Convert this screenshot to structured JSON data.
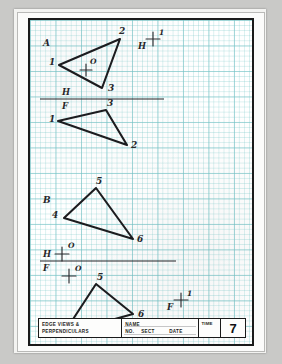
{
  "document": {
    "type": "engineering-graphics-worksheet",
    "sheet_number": "7"
  },
  "title_block": {
    "description_line1": "EDGE VIEWS &",
    "description_line2": "PERPENDICULARS",
    "name_label": "NAME",
    "no_label": "NO.",
    "sect_label": "SECT",
    "date_label": "DATE",
    "time_label": "TIME",
    "page_number": "7"
  },
  "problems": [
    {
      "id": "A",
      "label": "A",
      "views": [
        {
          "view": "horizontal",
          "plane_label": "H",
          "point_label": "O",
          "vertices": [
            {
              "label": "1",
              "x": 29,
              "y": 45
            },
            {
              "label": "2",
              "x": 90,
              "y": 19
            },
            {
              "label": "3",
              "x": 72,
              "y": 68
            }
          ]
        },
        {
          "view": "frontal",
          "plane_label": "F",
          "vertices": [
            {
              "label": "1",
              "x": 28,
              "y": 101
            },
            {
              "label": "3",
              "x": 76,
              "y": 90
            },
            {
              "label": "2",
              "x": 97,
              "y": 125
            }
          ]
        }
      ],
      "fold_line": {
        "label_top": "H",
        "label_bottom": "F",
        "y": 79
      },
      "aux_mark": {
        "plane_label": "H",
        "prime": "1",
        "x": 122,
        "y": 22
      }
    },
    {
      "id": "B",
      "label": "B",
      "views": [
        {
          "view": "horizontal",
          "plane_label": "H",
          "point_label": "O",
          "vertices": [
            {
              "label": "5",
              "x": 66,
              "y": 168
            },
            {
              "label": "4",
              "x": 34,
              "y": 198
            },
            {
              "label": "6",
              "x": 103,
              "y": 219
            }
          ]
        },
        {
          "view": "frontal",
          "plane_label": "F",
          "point_label": "O",
          "vertices": [
            {
              "label": "5",
              "x": 66,
              "y": 264
            },
            {
              "label": "6",
              "x": 103,
              "y": 294
            },
            {
              "label": "4",
              "x": 34,
              "y": 313
            }
          ]
        }
      ],
      "fold_line": {
        "label_top": "H",
        "label_bottom": "F",
        "y": 241
      },
      "aux_mark": {
        "plane_label": "F",
        "prime": "1",
        "x": 150,
        "y": 283
      }
    }
  ],
  "marks": {
    "section_a": "A",
    "section_b": "B",
    "origin": "O",
    "prime": "1",
    "h_plane": "H",
    "f_plane": "F",
    "v1": "1",
    "v2": "2",
    "v3": "3",
    "v4": "4",
    "v5": "5",
    "v6": "6"
  },
  "colors": {
    "ink": "#1a1a1a",
    "grid": "#6ebec3",
    "paper": "#ffffff",
    "scan_background": "#c9c9c7"
  }
}
